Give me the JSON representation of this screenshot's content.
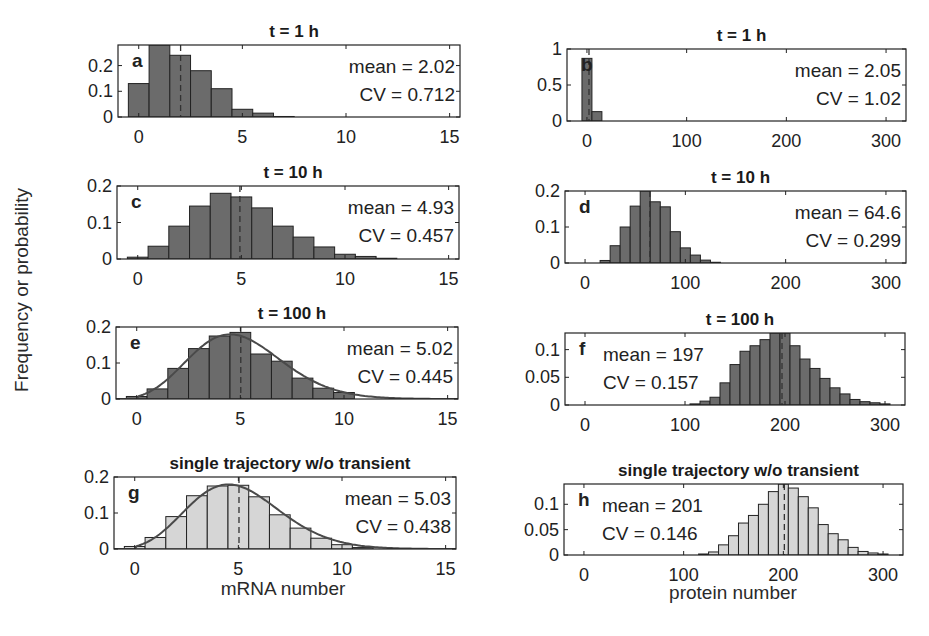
{
  "figure": {
    "ylabel": "Frequency or probability",
    "xlabel_left": "mRNA number",
    "xlabel_right": "protein number"
  },
  "colors": {
    "dark_bar": "#6b6b6b",
    "light_bar": "#d6d6d6",
    "edge": "#222222",
    "fit_line": "#4a4a4a"
  },
  "chart_data": [
    {
      "panel": "a",
      "type": "bar",
      "title": "t = 1 h",
      "xlabel": "",
      "ylabel": "Frequency or probability",
      "xlim": [
        -1,
        15.5
      ],
      "ylim": [
        0,
        0.28
      ],
      "xticks": [
        0,
        5,
        10,
        15
      ],
      "yticks": [
        0,
        0.1,
        0.2
      ],
      "ytick_labels": [
        "0",
        "0.1",
        "0.2"
      ],
      "bin_width": 1,
      "x": [
        0,
        1,
        2,
        3,
        4,
        5,
        6,
        7
      ],
      "values": [
        0.13,
        0.28,
        0.24,
        0.18,
        0.11,
        0.03,
        0.015,
        0.002
      ],
      "mean_line": 2.02,
      "fill": "dark",
      "annotation": [
        "mean = 2.02",
        "CV = 0.712"
      ],
      "annot_pos": "right"
    },
    {
      "panel": "b",
      "type": "bar",
      "title": "t = 1 h",
      "xlim": [
        -20,
        320
      ],
      "ylim": [
        0,
        1
      ],
      "xticks": [
        0,
        100,
        200,
        300
      ],
      "yticks": [
        0,
        0.5,
        1
      ],
      "ytick_labels": [
        "0",
        "0.5",
        "1"
      ],
      "bin_width": 10,
      "x": [
        0,
        10
      ],
      "values": [
        0.87,
        0.13
      ],
      "mean_line": 2.05,
      "fill": "dark",
      "annotation": [
        "mean = 2.05",
        "CV = 1.02"
      ],
      "annot_pos": "right"
    },
    {
      "panel": "c",
      "type": "bar",
      "title": "t = 10 h",
      "xlim": [
        -1,
        15.5
      ],
      "ylim": [
        0,
        0.2
      ],
      "xticks": [
        0,
        5,
        10,
        15
      ],
      "yticks": [
        0,
        0.1,
        0.2
      ],
      "ytick_labels": [
        "0",
        "0.1",
        "0.2"
      ],
      "bin_width": 1,
      "x": [
        0,
        1,
        2,
        3,
        4,
        5,
        6,
        7,
        8,
        9,
        10,
        11,
        12
      ],
      "values": [
        0.005,
        0.035,
        0.09,
        0.145,
        0.18,
        0.17,
        0.14,
        0.09,
        0.06,
        0.033,
        0.013,
        0.007,
        0.002
      ],
      "mean_line": 4.93,
      "fill": "dark",
      "annotation": [
        "mean = 4.93",
        "CV = 0.457"
      ],
      "annot_pos": "right"
    },
    {
      "panel": "d",
      "type": "bar",
      "title": "t = 10 h",
      "xlim": [
        -20,
        320
      ],
      "ylim": [
        0,
        0.2
      ],
      "xticks": [
        0,
        100,
        200,
        300
      ],
      "yticks": [
        0,
        0.1,
        0.2
      ],
      "ytick_labels": [
        "0",
        "0.1",
        "0.2"
      ],
      "bin_width": 10,
      "x": [
        20,
        30,
        40,
        50,
        60,
        70,
        80,
        90,
        100,
        110,
        120,
        130
      ],
      "values": [
        0.007,
        0.048,
        0.1,
        0.158,
        0.2,
        0.17,
        0.156,
        0.087,
        0.042,
        0.022,
        0.008,
        0.002
      ],
      "mean_line": 64.6,
      "fill": "dark",
      "annotation": [
        "mean = 64.6",
        "CV = 0.299"
      ],
      "annot_pos": "right"
    },
    {
      "panel": "e",
      "type": "bar",
      "title": "t = 100 h",
      "xlim": [
        -1,
        15.5
      ],
      "ylim": [
        0,
        0.2
      ],
      "xticks": [
        0,
        5,
        10,
        15
      ],
      "yticks": [
        0,
        0.1,
        0.2
      ],
      "ytick_labels": [
        "0",
        "0.1",
        "0.2"
      ],
      "bin_width": 1,
      "x": [
        0,
        1,
        2,
        3,
        4,
        5,
        6,
        7,
        8,
        9,
        10
      ],
      "values": [
        0.007,
        0.028,
        0.085,
        0.14,
        0.175,
        0.185,
        0.125,
        0.105,
        0.058,
        0.03,
        0.018
      ],
      "mean_line": 5.02,
      "fill": "dark",
      "fit_curve": {
        "type": "poisson",
        "lambda": 5.02
      },
      "annotation": [
        "mean = 5.02",
        "CV = 0.445"
      ],
      "annot_pos": "right"
    },
    {
      "panel": "f",
      "type": "bar",
      "title": "t = 100 h",
      "xlim": [
        -20,
        320
      ],
      "ylim": [
        0,
        0.13
      ],
      "xticks": [
        0,
        100,
        200,
        300
      ],
      "yticks": [
        0,
        0.05,
        0.1
      ],
      "ytick_labels": [
        "0",
        "0.05",
        "0.1"
      ],
      "bin_width": 10,
      "x": [
        110,
        120,
        130,
        140,
        150,
        160,
        170,
        180,
        190,
        200,
        210,
        220,
        230,
        240,
        250,
        260,
        270,
        280,
        290,
        300
      ],
      "values": [
        0.002,
        0.007,
        0.014,
        0.04,
        0.073,
        0.097,
        0.107,
        0.118,
        0.13,
        0.13,
        0.107,
        0.083,
        0.066,
        0.048,
        0.031,
        0.02,
        0.01,
        0.006,
        0.004,
        0.002
      ],
      "mean_line": 197,
      "fill": "dark",
      "annotation": [
        "mean = 197",
        "CV = 0.157"
      ],
      "annot_pos": "left"
    },
    {
      "panel": "g",
      "type": "bar",
      "title": "single trajectory w/o transient",
      "xlabel": "mRNA number",
      "xlim": [
        -1,
        15.5
      ],
      "ylim": [
        0,
        0.2
      ],
      "xticks": [
        0,
        5,
        10,
        15
      ],
      "yticks": [
        0,
        0.1,
        0.2
      ],
      "ytick_labels": [
        "0",
        "0.1",
        "0.2"
      ],
      "bin_width": 1,
      "x": [
        0,
        1,
        2,
        3,
        4,
        5,
        6,
        7,
        8,
        9,
        10,
        11
      ],
      "values": [
        0.007,
        0.032,
        0.09,
        0.148,
        0.175,
        0.177,
        0.145,
        0.095,
        0.058,
        0.03,
        0.012,
        0.004
      ],
      "mean_line": 5.03,
      "fill": "light",
      "fit_curve": {
        "type": "poisson",
        "lambda": 5.03
      },
      "annotation": [
        "mean = 5.03",
        "CV = 0.438"
      ],
      "annot_pos": "right"
    },
    {
      "panel": "h",
      "type": "bar",
      "title": "single trajectory w/o transient",
      "xlabel": "protein number",
      "xlim": [
        -20,
        320
      ],
      "ylim": [
        0,
        0.14
      ],
      "xticks": [
        0,
        100,
        200,
        300
      ],
      "yticks": [
        0,
        0.05,
        0.1
      ],
      "ytick_labels": [
        "0",
        "0.05",
        "0.1"
      ],
      "bin_width": 10,
      "x": [
        120,
        130,
        140,
        150,
        160,
        170,
        180,
        190,
        200,
        210,
        220,
        230,
        240,
        250,
        260,
        270,
        280,
        290,
        300
      ],
      "values": [
        0.002,
        0.006,
        0.02,
        0.038,
        0.063,
        0.078,
        0.1,
        0.125,
        0.14,
        0.132,
        0.115,
        0.093,
        0.06,
        0.042,
        0.03,
        0.015,
        0.007,
        0.004,
        0.002
      ],
      "mean_line": 201,
      "fill": "light",
      "annotation": [
        "mean = 201",
        "CV = 0.146"
      ],
      "annot_pos": "left"
    }
  ],
  "layout_boxes": {
    "a": {
      "left": 118,
      "top": 45,
      "right": 460,
      "bottom": 117
    },
    "b": {
      "left": 567,
      "top": 49,
      "right": 906,
      "bottom": 121
    },
    "c": {
      "left": 117,
      "top": 186,
      "right": 459,
      "bottom": 259
    },
    "d": {
      "left": 565,
      "top": 191,
      "right": 906,
      "bottom": 263
    },
    "e": {
      "left": 116,
      "top": 327,
      "right": 458,
      "bottom": 399
    },
    "f": {
      "left": 565,
      "top": 333,
      "right": 905,
      "bottom": 405
    },
    "g": {
      "left": 114,
      "top": 477,
      "right": 456,
      "bottom": 549
    },
    "h": {
      "left": 564,
      "top": 484,
      "right": 903,
      "bottom": 555
    }
  }
}
